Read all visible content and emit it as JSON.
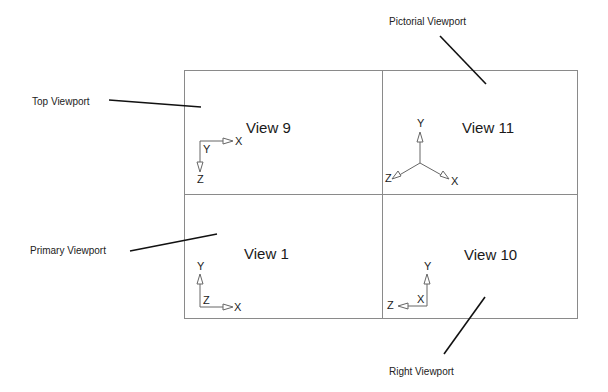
{
  "callouts": {
    "pictorial": "Pictorial Viewport",
    "top": "Top Viewport",
    "primary": "Primary Viewport",
    "right": "Right Viewport"
  },
  "viewports": [
    {
      "id": "top",
      "title": "View 9",
      "axes": {
        "horizontal": "X",
        "vertical_down": "Z",
        "origin_label": "Y"
      }
    },
    {
      "id": "pictorial",
      "title": "View 11",
      "axes": {
        "up": "Y",
        "right_down": "X",
        "left_down": "Z"
      }
    },
    {
      "id": "primary",
      "title": "View 1",
      "axes": {
        "up": "Y",
        "horizontal": "X",
        "origin_label": "Z"
      }
    },
    {
      "id": "right",
      "title": "View 10",
      "axes": {
        "up": "Y",
        "horizontal_left": "Z",
        "origin_label": "X"
      }
    }
  ],
  "colors": {
    "frame": "#8a8a8a",
    "leader": "#111111",
    "axis": "#555555",
    "text": "#1a1a1a"
  }
}
